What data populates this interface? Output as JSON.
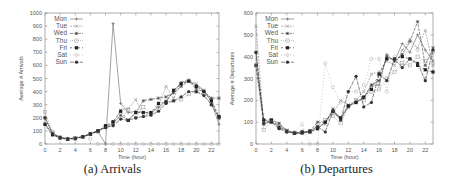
{
  "captions": {
    "a": "(a) Arrivals",
    "b": "(b) Departures"
  },
  "chart_data": [
    {
      "type": "line",
      "title": "",
      "caption": "(a) Arrivals",
      "xlabel": "Time (hour)",
      "ylabel": "Average # Arrivals",
      "xlim": [
        0,
        23
      ],
      "ylim": [
        0,
        1000
      ],
      "xticks": [
        0,
        2,
        4,
        6,
        8,
        10,
        12,
        14,
        16,
        18,
        20,
        22
      ],
      "yticks": [
        0,
        100,
        200,
        300,
        400,
        500,
        600,
        700,
        800,
        900,
        1000
      ],
      "grid": false,
      "legend_position": "upper left",
      "x": [
        0,
        1,
        2,
        3,
        4,
        5,
        6,
        7,
        8,
        9,
        10,
        11,
        12,
        13,
        14,
        15,
        16,
        17,
        18,
        19,
        20,
        21,
        22,
        23
      ],
      "series": [
        {
          "name": "Mon",
          "values": [
            150,
            70,
            45,
            40,
            45,
            55,
            75,
            95,
            0,
            920,
            310,
            240,
            250,
            240,
            235,
            280,
            330,
            400,
            470,
            480,
            450,
            410,
            320,
            150
          ]
        },
        {
          "name": "Tue",
          "values": [
            160,
            75,
            50,
            40,
            45,
            55,
            75,
            100,
            125,
            150,
            260,
            270,
            340,
            210,
            240,
            290,
            440,
            350,
            470,
            490,
            460,
            410,
            340,
            200
          ]
        },
        {
          "name": "Wed",
          "values": [
            200,
            80,
            50,
            40,
            45,
            55,
            80,
            100,
            130,
            160,
            220,
            180,
            240,
            330,
            340,
            350,
            360,
            390,
            440,
            480,
            420,
            400,
            350,
            350
          ]
        },
        {
          "name": "Thu",
          "values": [
            245,
            90,
            50,
            40,
            45,
            55,
            75,
            95,
            130,
            160,
            200,
            260,
            200,
            280,
            230,
            270,
            320,
            330,
            340,
            380,
            400,
            380,
            300,
            200
          ]
        },
        {
          "name": "Fri",
          "values": [
            150,
            70,
            45,
            35,
            40,
            55,
            75,
            100,
            140,
            170,
            250,
            180,
            240,
            240,
            240,
            310,
            320,
            410,
            460,
            480,
            440,
            400,
            330,
            210
          ]
        },
        {
          "name": "Sat",
          "values": [
            200,
            90,
            50,
            40,
            45,
            50,
            40,
            0,
            0,
            0,
            0,
            0,
            0,
            0,
            0,
            0,
            0,
            0,
            0,
            0,
            0,
            0,
            0,
            0
          ]
        },
        {
          "name": "Sun",
          "values": [
            200,
            80,
            50,
            40,
            45,
            55,
            80,
            100,
            125,
            140,
            190,
            180,
            200,
            210,
            220,
            250,
            310,
            330,
            360,
            400,
            400,
            370,
            300,
            200
          ]
        }
      ]
    },
    {
      "type": "line",
      "title": "",
      "caption": "(b) Departures",
      "xlabel": "Time (hour)",
      "ylabel": "Average # Departures",
      "xlim": [
        0,
        23
      ],
      "ylim": [
        0,
        600
      ],
      "xticks": [
        0,
        2,
        4,
        6,
        8,
        10,
        12,
        14,
        16,
        18,
        20,
        22
      ],
      "yticks": [
        0,
        100,
        200,
        300,
        400,
        500,
        600
      ],
      "grid": false,
      "legend_position": "upper left",
      "x": [
        0,
        1,
        2,
        3,
        4,
        5,
        6,
        7,
        8,
        9,
        10,
        11,
        12,
        13,
        14,
        15,
        16,
        17,
        18,
        19,
        20,
        21,
        22,
        23
      ],
      "series": [
        {
          "name": "Mon",
          "values": [
            360,
            110,
            100,
            85,
            60,
            50,
            50,
            55,
            70,
            100,
            150,
            120,
            175,
            195,
            210,
            270,
            270,
            410,
            380,
            460,
            420,
            500,
            430,
            380
          ]
        },
        {
          "name": "Tue",
          "values": [
            540,
            100,
            105,
            90,
            65,
            50,
            60,
            55,
            80,
            90,
            140,
            200,
            180,
            200,
            240,
            320,
            330,
            380,
            360,
            430,
            480,
            440,
            520,
            360
          ]
        },
        {
          "name": "Wed",
          "values": [
            420,
            90,
            110,
            95,
            60,
            50,
            50,
            60,
            100,
            100,
            160,
            110,
            170,
            190,
            210,
            270,
            290,
            400,
            380,
            410,
            470,
            560,
            360,
            440
          ]
        },
        {
          "name": "Thu",
          "values": [
            360,
            65,
            100,
            80,
            55,
            50,
            50,
            60,
            80,
            110,
            130,
            95,
            170,
            200,
            200,
            240,
            250,
            300,
            330,
            370,
            360,
            400,
            380,
            420
          ]
        },
        {
          "name": "Fri",
          "values": [
            360,
            110,
            110,
            75,
            60,
            50,
            55,
            55,
            70,
            100,
            150,
            120,
            175,
            190,
            215,
            250,
            320,
            390,
            390,
            400,
            390,
            360,
            340,
            330
          ]
        },
        {
          "name": "Sat",
          "values": [
            360,
            90,
            100,
            80,
            60,
            55,
            90,
            0,
            0,
            370,
            260,
            190,
            240,
            240,
            270,
            390,
            390,
            240,
            400,
            360,
            470,
            430,
            300,
            370
          ]
        },
        {
          "name": "Sun",
          "values": [
            420,
            95,
            100,
            70,
            55,
            50,
            50,
            60,
            80,
            55,
            150,
            110,
            240,
            310,
            170,
            190,
            320,
            290,
            390,
            350,
            390,
            370,
            290,
            430
          ]
        }
      ]
    }
  ]
}
